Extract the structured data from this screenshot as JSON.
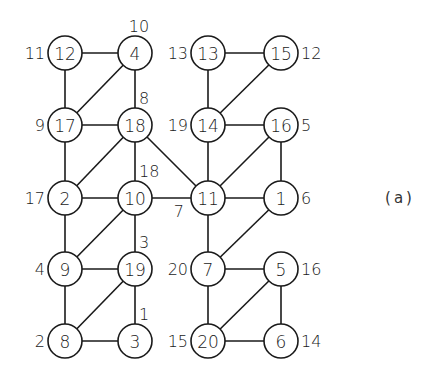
{
  "diagram": {
    "caption": "(a)",
    "node_radius": 17,
    "nodes": [
      {
        "id": "12",
        "x": 65,
        "y": 53,
        "label": "11",
        "label_pos": "left"
      },
      {
        "id": "4",
        "x": 135,
        "y": 53,
        "label": "10",
        "label_pos": "top"
      },
      {
        "id": "13",
        "x": 208,
        "y": 53,
        "label": "13",
        "label_pos": "left"
      },
      {
        "id": "15",
        "x": 281,
        "y": 53,
        "label": "12",
        "label_pos": "right"
      },
      {
        "id": "17",
        "x": 65,
        "y": 125,
        "label": "9",
        "label_pos": "left"
      },
      {
        "id": "18",
        "x": 135,
        "y": 125,
        "label": "8",
        "label_pos": "top-right"
      },
      {
        "id": "14",
        "x": 208,
        "y": 125,
        "label": "19",
        "label_pos": "left"
      },
      {
        "id": "16",
        "x": 281,
        "y": 125,
        "label": "5",
        "label_pos": "right"
      },
      {
        "id": "2",
        "x": 65,
        "y": 198,
        "label": "17",
        "label_pos": "left"
      },
      {
        "id": "10",
        "x": 135,
        "y": 198,
        "label": "18",
        "label_pos": "top-right"
      },
      {
        "id": "11",
        "x": 208,
        "y": 198,
        "label": "7",
        "label_pos": "bottom-left"
      },
      {
        "id": "1",
        "x": 281,
        "y": 198,
        "label": "6",
        "label_pos": "right"
      },
      {
        "id": "9",
        "x": 65,
        "y": 269,
        "label": "4",
        "label_pos": "left"
      },
      {
        "id": "19",
        "x": 135,
        "y": 269,
        "label": "3",
        "label_pos": "top-right"
      },
      {
        "id": "7",
        "x": 208,
        "y": 269,
        "label": "20",
        "label_pos": "left"
      },
      {
        "id": "5",
        "x": 281,
        "y": 269,
        "label": "16",
        "label_pos": "right"
      },
      {
        "id": "8",
        "x": 65,
        "y": 341,
        "label": "2",
        "label_pos": "left"
      },
      {
        "id": "3",
        "x": 135,
        "y": 341,
        "label": "1",
        "label_pos": "top-right"
      },
      {
        "id": "20",
        "x": 208,
        "y": 341,
        "label": "15",
        "label_pos": "left"
      },
      {
        "id": "6",
        "x": 281,
        "y": 341,
        "label": "14",
        "label_pos": "right"
      }
    ],
    "edges": [
      [
        "12",
        "4"
      ],
      [
        "12",
        "17"
      ],
      [
        "4",
        "17"
      ],
      [
        "4",
        "18"
      ],
      [
        "17",
        "18"
      ],
      [
        "17",
        "2"
      ],
      [
        "18",
        "2"
      ],
      [
        "18",
        "10"
      ],
      [
        "18",
        "11"
      ],
      [
        "2",
        "10"
      ],
      [
        "2",
        "9"
      ],
      [
        "10",
        "9"
      ],
      [
        "10",
        "19"
      ],
      [
        "10",
        "11"
      ],
      [
        "9",
        "19"
      ],
      [
        "9",
        "8"
      ],
      [
        "19",
        "8"
      ],
      [
        "19",
        "3"
      ],
      [
        "8",
        "3"
      ],
      [
        "13",
        "15"
      ],
      [
        "13",
        "14"
      ],
      [
        "15",
        "14"
      ],
      [
        "14",
        "16"
      ],
      [
        "14",
        "11"
      ],
      [
        "16",
        "11"
      ],
      [
        "16",
        "1"
      ],
      [
        "11",
        "1"
      ],
      [
        "11",
        "7"
      ],
      [
        "1",
        "7"
      ],
      [
        "7",
        "5"
      ],
      [
        "7",
        "20"
      ],
      [
        "5",
        "20"
      ],
      [
        "5",
        "6"
      ],
      [
        "20",
        "6"
      ]
    ],
    "colors": {
      "stroke": "#1a1a1a",
      "fill": "#ffffff",
      "text": "#1a1a1a"
    }
  }
}
